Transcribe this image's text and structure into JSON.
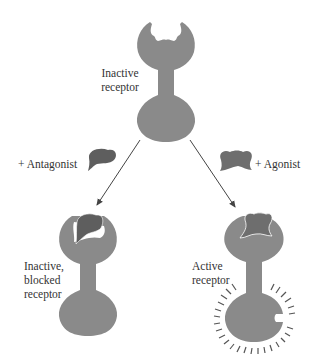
{
  "diagram": {
    "colors": {
      "receptor": "#8a8a8a",
      "antagonist": "#5e5e5e",
      "agonist": "#6e6e6e",
      "text": "#333333",
      "arrow": "#444444"
    },
    "top": {
      "label_line1": "Inactive",
      "label_line2": "receptor"
    },
    "left": {
      "ligand_label": "+ Antagonist",
      "label_line1": "Inactive,",
      "label_line2": "blocked",
      "label_line3": "receptor"
    },
    "right": {
      "ligand_label": "+ Agonist",
      "label_line1": "Active",
      "label_line2": "receptor"
    }
  }
}
